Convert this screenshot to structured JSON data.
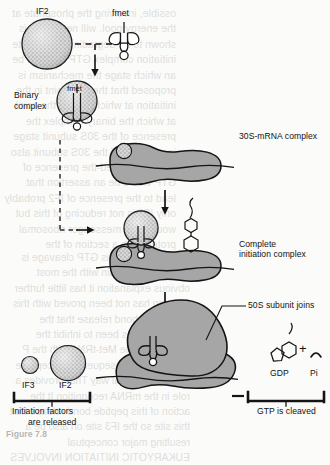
{
  "figure": {
    "title_caption": "Figure 7.8",
    "domain": "prokaryotic translation initiation diagram"
  },
  "labels": {
    "if2_top": "IF2",
    "fmet_top": "fmet",
    "binary_complex_line1": "Binary",
    "binary_complex_line2": "complex",
    "fmet_binary": "fmet",
    "s30_mrna_complex": "30S-mRNA complex",
    "complete_line1": "Complete",
    "complete_line2": "initiation complex",
    "fifty_s_joins": "50S subunit joins",
    "gdp": "GDP",
    "plus": "+",
    "pi": "Pi",
    "gtp_cleaved": "GTP is cleaved",
    "if3_bottom": "IF3",
    "if2_bottom": "IF2",
    "released_line1": "Initiation factors",
    "released_line2": "are released"
  },
  "icons": {
    "if2_sphere": "stippled-circle-icon",
    "if3_sphere": "stippled-circle-icon",
    "trna": "trna-cloverleaf-icon",
    "ribosome_30s": "ribosome-30s-subunit-icon",
    "ribosome_50s": "ribosome-50s-subunit-icon",
    "mrna_strand": "mrna-line-icon",
    "gtp_molecule": "gtp-nucleotide-icon",
    "gdp_molecule": "gdp-nucleotide-icon",
    "pi_molecule": "inorganic-phosphate-icon",
    "arrow_down": "arrow-down-icon",
    "dashed_arrow": "dashed-arrow-icon",
    "bracket_left": "bracket-icon",
    "bracket_right": "bracket-icon",
    "leader_line": "leader-line-icon"
  },
  "colors": {
    "ribosome_fill": "#a6a6a6",
    "stipple_fill": "#cfcfcf",
    "stroke": "#141414",
    "page_background": "#fbfbf9",
    "ghost_text": "#4a4a46"
  },
  "ghost_text": {
    "column_top": "ossible, involving the phosphate at the energy pool. will need GTP is shown to be degrading a complete initiation complex GTP will then be an which stage the mechanism is proposed that the to a point in the initiation at which bind to the point at which the binary complex the presence of the 30S subunit stage in structure of the 30S subunit also an effect if used-the presence of GTP would be an assertion that lead to the presence of IF2 probably only IF2 is not reducing of this but would be a messenger ribosomal protein with a section of the",
    "column_bottom": "The function of this GTP cleavage is presently uncertain with the most obvious explanation it has little further concern has not been proved with this phosphate bond release that the placement has been to inhibit the mRNA site The Met-tRNA with the P site and the subsequent to accept the GTP in the usual way That provides a role in the mRNA recognition It the action of this peptide bond release that this site so the IF3 site on also be a resulting major conceptual EUKARYOTIC INITIATION INVOLVES"
  }
}
